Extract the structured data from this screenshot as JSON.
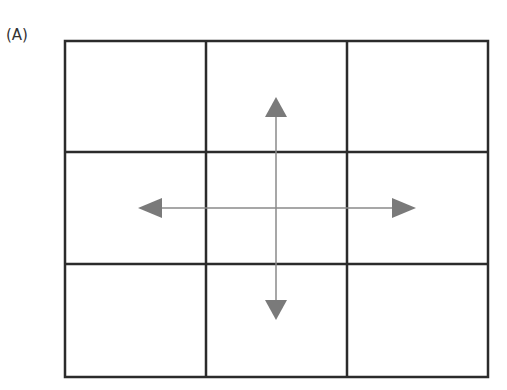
{
  "figure": {
    "label": "(A)",
    "grid": {
      "rows": 3,
      "cols": 3,
      "line_color": "#2b2b2b"
    },
    "arrows": [
      {
        "direction": "up",
        "color": "#7a7a7a"
      },
      {
        "direction": "down",
        "color": "#7a7a7a"
      },
      {
        "direction": "left",
        "color": "#7a7a7a"
      },
      {
        "direction": "right",
        "color": "#7a7a7a"
      }
    ]
  }
}
